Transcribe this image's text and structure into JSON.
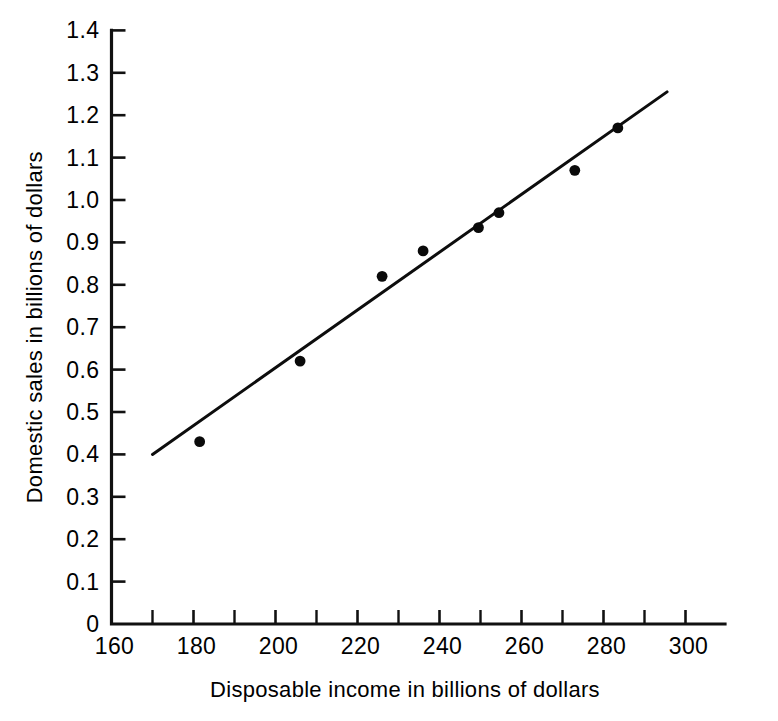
{
  "chart_data": {
    "type": "scatter",
    "title": "",
    "xlabel": "Disposable income in billions of dollars",
    "ylabel": "Domestic sales in billions of dollars",
    "xlim": [
      160,
      310
    ],
    "ylim": [
      0,
      1.4
    ],
    "grid": false,
    "legend": "none",
    "x_major_ticks": [
      160,
      180,
      200,
      220,
      240,
      260,
      280,
      300
    ],
    "x_minor_ticks": [
      170,
      190,
      210,
      230,
      250,
      270,
      290
    ],
    "x_tick_labels": [
      "160",
      "180",
      "200",
      "220",
      "240",
      "260",
      "280",
      "300"
    ],
    "y_major_ticks": [
      0,
      0.1,
      0.2,
      0.3,
      0.4,
      0.5,
      0.6,
      0.7,
      0.8,
      0.9,
      1.0,
      1.1,
      1.2,
      1.3,
      1.4
    ],
    "y_tick_labels": [
      "0",
      "0.1",
      "0.2",
      "0.3",
      "0.4",
      "0.5",
      "0.6",
      "0.7",
      "0.8",
      "0.9",
      "1.0",
      "1.1",
      "1.2",
      "1.3",
      "1.4"
    ],
    "points": [
      {
        "x": 181.5,
        "y": 0.43
      },
      {
        "x": 206.0,
        "y": 0.62
      },
      {
        "x": 226.0,
        "y": 0.82
      },
      {
        "x": 236.0,
        "y": 0.88
      },
      {
        "x": 249.5,
        "y": 0.935
      },
      {
        "x": 254.5,
        "y": 0.97
      },
      {
        "x": 273.0,
        "y": 1.07
      },
      {
        "x": 283.5,
        "y": 1.17
      }
    ],
    "fit_line": {
      "name": "least squares fit",
      "x_start": 170.0,
      "y_start": 0.4,
      "x_end": 295.5,
      "y_end": 1.255
    },
    "colors": {
      "axis": "#111111",
      "point": "#0a0a0a",
      "line": "#0d0d0d",
      "background": "#ffffff"
    }
  }
}
